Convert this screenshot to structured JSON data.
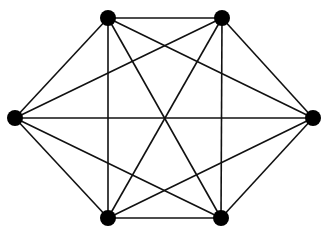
{
  "diagram": {
    "type": "complete-graph",
    "name": "K6",
    "node_color": "#000000",
    "edge_color": "#111111",
    "node_radius": 8,
    "nodes": [
      {
        "id": "top-left",
        "x": 108,
        "y": 18
      },
      {
        "id": "top-right",
        "x": 222,
        "y": 18
      },
      {
        "id": "right",
        "x": 313,
        "y": 118
      },
      {
        "id": "bottom-right",
        "x": 221,
        "y": 218
      },
      {
        "id": "bottom-left",
        "x": 108,
        "y": 218
      },
      {
        "id": "left",
        "x": 15,
        "y": 118
      }
    ],
    "edges": [
      [
        "top-left",
        "top-right"
      ],
      [
        "top-left",
        "right"
      ],
      [
        "top-left",
        "bottom-right"
      ],
      [
        "top-left",
        "bottom-left"
      ],
      [
        "top-left",
        "left"
      ],
      [
        "top-right",
        "right"
      ],
      [
        "top-right",
        "bottom-right"
      ],
      [
        "top-right",
        "bottom-left"
      ],
      [
        "top-right",
        "left"
      ],
      [
        "right",
        "bottom-right"
      ],
      [
        "right",
        "bottom-left"
      ],
      [
        "right",
        "left"
      ],
      [
        "bottom-right",
        "bottom-left"
      ],
      [
        "bottom-right",
        "left"
      ],
      [
        "bottom-left",
        "left"
      ]
    ]
  }
}
